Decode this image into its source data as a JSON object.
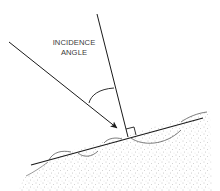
{
  "diagram": {
    "title_lines": [
      "INCIDENCE",
      "ANGLE"
    ],
    "elements": {
      "incident_ray": {
        "from": [
          9,
          42
        ],
        "to": [
          117,
          128
        ],
        "arrow": "end"
      },
      "surface_normal": {
        "from": [
          97,
          14
        ],
        "to": [
          128,
          137
        ]
      },
      "surface_line": {
        "from": [
          31,
          165
        ],
        "to": [
          203,
          118
        ]
      },
      "right_angle_marker": true,
      "incidence_angle_arc": true,
      "ground": "stippled terrain below surface line"
    },
    "colors": {
      "stroke": "#1a1a1a",
      "text": "#3a3a3a",
      "stipple": "#8a8a8a",
      "background": "#ffffff"
    }
  }
}
